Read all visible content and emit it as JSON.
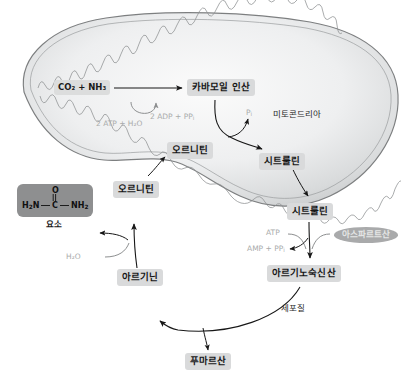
{
  "figure": {
    "kind": "urea-cycle-diagram",
    "compartments": {
      "mitochondrion_label": "미토콘드리아",
      "cytosol_label": "세포질"
    },
    "colors": {
      "chip_bg": "#d9dadb",
      "urea_box_bg": "#8e8f90",
      "aspartate_oval_bg": "#a9aaab",
      "faint_text": "#a9abab",
      "outline": "#7d7f80",
      "mito_fill_light": "#f1f2f2",
      "mito_fill_dark": "#c9cbcc",
      "arrow": "#1a1a1a",
      "arrow_faint": "#8d8f90"
    },
    "metabolites": [
      {
        "id": "co2-nh3",
        "label": "CO₂ + NH₃",
        "compartment": "mitochondrion"
      },
      {
        "id": "carbamoyl-phosphate",
        "label": "카바모일 인산",
        "compartment": "mitochondrion"
      },
      {
        "id": "ornithine-mito",
        "label": "오르니틴",
        "compartment": "mitochondrion"
      },
      {
        "id": "citrulline-mito",
        "label": "시트룰린",
        "compartment": "mitochondrion"
      },
      {
        "id": "citrulline-cyto",
        "label": "시트룰린",
        "compartment": "cytosol"
      },
      {
        "id": "argininosuccinate",
        "label": "아르기노숙신산",
        "compartment": "cytosol"
      },
      {
        "id": "fumarate",
        "label": "푸마르산",
        "compartment": "cytosol"
      },
      {
        "id": "arginine",
        "label": "아르기닌",
        "compartment": "cytosol"
      },
      {
        "id": "ornithine-cyto",
        "label": "오르니틴",
        "compartment": "cytosol"
      },
      {
        "id": "urea",
        "label": "요소",
        "compartment": "cytosol"
      }
    ],
    "cofactors": [
      {
        "id": "atp-in",
        "label": "2 ATP + H₂O"
      },
      {
        "id": "adp-out",
        "label": "2 ADP + PP",
        "sub": "i"
      },
      {
        "id": "pi",
        "label": "P",
        "sub": "i"
      },
      {
        "id": "atp",
        "label": "ATP"
      },
      {
        "id": "amp-ppi",
        "label": "AMP + PP",
        "sub": "i"
      },
      {
        "id": "water",
        "label": "H₂O"
      }
    ],
    "aspartate": {
      "label": "아스파르트산"
    },
    "urea_structure": {
      "oxygen": "O",
      "formula_left": "H₂N",
      "formula_center": "C",
      "formula_right": "NH₂",
      "name": "요소"
    }
  }
}
